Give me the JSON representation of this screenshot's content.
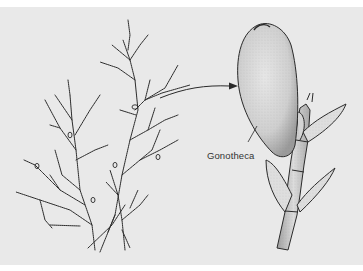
{
  "figure": {
    "labels": [
      {
        "id": "gonotheca",
        "text": "Gonotheca"
      }
    ]
  },
  "colors": {
    "background": "#e9e9e9",
    "border_top": "#ffffff",
    "ink": "#2a2a2a",
    "stipple_fill": "#d8d8d8"
  },
  "parts": {
    "left": "branching-colony",
    "connector": "arrow",
    "right": "enlarged-gonotheca-on-stalk"
  }
}
